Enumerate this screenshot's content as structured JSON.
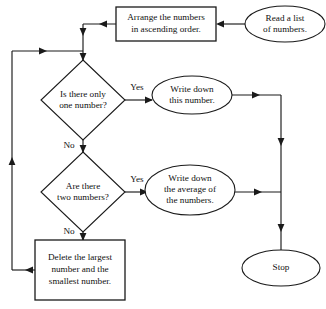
{
  "diagram": {
    "type": "flowchart",
    "canvas": {
      "width": 326,
      "height": 309
    },
    "colors": {
      "background": "#ffffff",
      "stroke": "#1a1a1a",
      "text": "#111111",
      "fill": "#ffffff"
    },
    "nodes": {
      "read": {
        "shape": "ellipse",
        "lines": [
          "Read a list",
          "of numbers."
        ],
        "cx": 285,
        "cy": 24,
        "rx": 40,
        "ry": 18
      },
      "arrange": {
        "shape": "rectangle",
        "lines": [
          "Arrange the numbers",
          "in ascending order."
        ],
        "x": 116,
        "y": 7,
        "w": 100,
        "h": 34
      },
      "decision_one": {
        "shape": "diamond",
        "lines": [
          "Is there only",
          "one number?"
        ],
        "cx": 83,
        "cy": 100,
        "rx": 42,
        "ry": 40
      },
      "write_this": {
        "shape": "ellipse",
        "lines": [
          "Write down",
          "this number."
        ],
        "cx": 192,
        "cy": 95,
        "rx": 40,
        "ry": 19
      },
      "decision_two": {
        "shape": "diamond",
        "lines": [
          "Are there",
          "two numbers?"
        ],
        "cx": 83,
        "cy": 192,
        "rx": 42,
        "ry": 40
      },
      "write_average": {
        "shape": "ellipse",
        "lines": [
          "Write down",
          "the average of",
          "the numbers."
        ],
        "cx": 190,
        "cy": 190,
        "rx": 45,
        "ry": 25
      },
      "delete": {
        "shape": "rectangle",
        "lines": [
          "Delete the largest",
          "number and the",
          "smallest number."
        ],
        "x": 35,
        "y": 240,
        "w": 90,
        "h": 60
      },
      "stop": {
        "shape": "ellipse",
        "lines": [
          "Stop"
        ],
        "cx": 281,
        "cy": 268,
        "rx": 39,
        "ry": 18
      }
    },
    "edge_labels": {
      "yes_one": {
        "text": "Yes",
        "x": 137,
        "y": 88
      },
      "no_one": {
        "text": "No",
        "x": 69,
        "y": 146
      },
      "yes_two": {
        "text": "Yes",
        "x": 137,
        "y": 180
      },
      "no_two": {
        "text": "No",
        "x": 69,
        "y": 232
      }
    },
    "edges": [
      {
        "from": "read",
        "to": "arrange",
        "label": ""
      },
      {
        "from": "arrange",
        "to": "decision_one",
        "label": ""
      },
      {
        "from": "decision_one",
        "to": "write_this",
        "label": "Yes"
      },
      {
        "from": "decision_one",
        "to": "decision_two",
        "label": "No"
      },
      {
        "from": "decision_two",
        "to": "write_average",
        "label": "Yes"
      },
      {
        "from": "decision_two",
        "to": "delete",
        "label": "No"
      },
      {
        "from": "delete",
        "to": "decision_one",
        "label": ""
      },
      {
        "from": "write_this",
        "to": "stop",
        "label": ""
      },
      {
        "from": "write_average",
        "to": "stop",
        "label": ""
      }
    ]
  }
}
